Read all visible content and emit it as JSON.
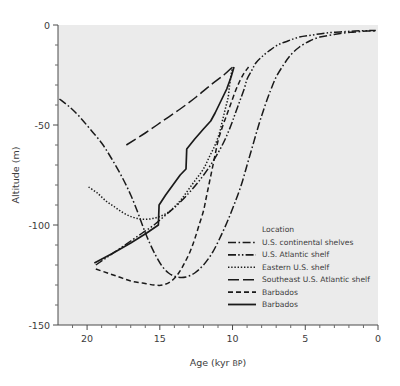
{
  "chart_data": {
    "type": "line",
    "title": "",
    "xlabel": "Age (kyr BP)",
    "ylabel": "Altitude (m)",
    "xlim": [
      22,
      0
    ],
    "ylim": [
      -150,
      0
    ],
    "x_ticks_major": [
      20,
      15,
      10,
      5,
      0
    ],
    "x_tick_labels": [
      "20",
      "15",
      "10",
      "5",
      "0"
    ],
    "x_ticks_minor": [
      21,
      19,
      18,
      17,
      16,
      14,
      13,
      12,
      11,
      9,
      8,
      7,
      6,
      4,
      3,
      2,
      1
    ],
    "y_ticks_major": [
      0,
      -50,
      -100,
      -150
    ],
    "y_tick_labels": [
      "0",
      "-50",
      "-100",
      "-150"
    ],
    "y_ticks_minor": [
      -10,
      -20,
      -30,
      -40,
      -60,
      -70,
      -80,
      -90,
      -110,
      -120,
      -130,
      -140
    ],
    "x_axis_reversed": true,
    "grid": false,
    "background_color": "#ebebeb",
    "line_color": "#1a1a1a",
    "legend": {
      "title": "Location",
      "position": "inside-lower-right"
    },
    "series": [
      {
        "name": "U.S. continental shelves",
        "style": "dashdot",
        "points": [
          [
            21.9,
            -37
          ],
          [
            21.2,
            -41
          ],
          [
            20.5,
            -46
          ],
          [
            19.8,
            -52
          ],
          [
            19.0,
            -59
          ],
          [
            18.3,
            -67
          ],
          [
            17.6,
            -76
          ],
          [
            17.0,
            -85
          ],
          [
            16.5,
            -94
          ],
          [
            16.1,
            -102
          ],
          [
            15.7,
            -109
          ],
          [
            15.3,
            -115
          ],
          [
            14.9,
            -120
          ],
          [
            14.4,
            -124
          ],
          [
            13.8,
            -126
          ],
          [
            13.2,
            -126
          ],
          [
            12.6,
            -124
          ],
          [
            12.0,
            -120
          ],
          [
            11.4,
            -114
          ],
          [
            10.9,
            -107
          ],
          [
            10.4,
            -99
          ],
          [
            9.9,
            -90
          ],
          [
            9.4,
            -80
          ],
          [
            9.0,
            -70
          ],
          [
            8.6,
            -60
          ],
          [
            8.2,
            -50
          ],
          [
            7.8,
            -41
          ],
          [
            7.4,
            -33
          ],
          [
            7.0,
            -26
          ],
          [
            6.5,
            -20
          ],
          [
            6.0,
            -15
          ],
          [
            5.4,
            -11
          ],
          [
            4.7,
            -8
          ],
          [
            4.0,
            -6
          ],
          [
            3.2,
            -5
          ],
          [
            2.4,
            -4
          ],
          [
            1.6,
            -3.5
          ],
          [
            0.8,
            -3
          ],
          [
            0.15,
            -3
          ]
        ]
      },
      {
        "name": "U.S. Atlantic shelf",
        "style": "dashdotdot",
        "points": [
          [
            19.4,
            -120
          ],
          [
            18.6,
            -116
          ],
          [
            17.8,
            -112
          ],
          [
            17.0,
            -108
          ],
          [
            16.2,
            -104
          ],
          [
            15.4,
            -100
          ],
          [
            14.6,
            -95
          ],
          [
            13.8,
            -90
          ],
          [
            13.0,
            -84
          ],
          [
            12.3,
            -78
          ],
          [
            11.6,
            -71
          ],
          [
            11.0,
            -64
          ],
          [
            10.5,
            -57
          ],
          [
            10.1,
            -50
          ],
          [
            9.8,
            -44
          ],
          [
            9.5,
            -38
          ],
          [
            9.2,
            -32
          ],
          [
            9.0,
            -27
          ],
          [
            8.7,
            -23
          ],
          [
            8.4,
            -19
          ],
          [
            8.0,
            -16
          ],
          [
            7.5,
            -13
          ],
          [
            6.9,
            -10
          ],
          [
            6.2,
            -8
          ],
          [
            5.4,
            -6
          ],
          [
            4.5,
            -5
          ],
          [
            3.6,
            -4
          ],
          [
            2.6,
            -3.5
          ],
          [
            1.6,
            -3
          ],
          [
            0.6,
            -2.8
          ],
          [
            0.15,
            -2.7
          ]
        ]
      },
      {
        "name": "Eastern U.S. shelf",
        "style": "dotted",
        "points": [
          [
            19.9,
            -81
          ],
          [
            19.3,
            -84
          ],
          [
            18.7,
            -88
          ],
          [
            18.1,
            -91
          ],
          [
            17.5,
            -94
          ],
          [
            16.9,
            -96
          ],
          [
            16.3,
            -97
          ],
          [
            15.7,
            -97
          ],
          [
            15.1,
            -96
          ],
          [
            14.5,
            -94
          ],
          [
            14.0,
            -91
          ],
          [
            13.5,
            -87
          ],
          [
            13.0,
            -82
          ],
          [
            12.5,
            -77
          ],
          [
            12.0,
            -72
          ],
          [
            11.6,
            -66
          ],
          [
            11.2,
            -60
          ],
          [
            10.9,
            -54
          ],
          [
            10.7,
            -48
          ],
          [
            10.5,
            -42
          ],
          [
            10.3,
            -36
          ],
          [
            10.2,
            -30
          ],
          [
            10.1,
            -25
          ],
          [
            10.0,
            -21
          ]
        ]
      },
      {
        "name": "Southeast U.S. Atlantic shelf",
        "style": "longdash",
        "points": [
          [
            17.3,
            -60
          ],
          [
            16.0,
            -54
          ],
          [
            14.8,
            -48
          ],
          [
            13.6,
            -42
          ],
          [
            12.5,
            -36
          ],
          [
            11.5,
            -30
          ],
          [
            10.6,
            -25
          ],
          [
            10.0,
            -21
          ]
        ]
      },
      {
        "name": "Barbados",
        "style": "dashed",
        "points": [
          [
            19.4,
            -122
          ],
          [
            18.6,
            -124
          ],
          [
            17.8,
            -126
          ],
          [
            17.0,
            -128
          ],
          [
            16.2,
            -129
          ],
          [
            15.4,
            -130
          ],
          [
            14.8,
            -130
          ],
          [
            14.2,
            -128
          ],
          [
            13.7,
            -124
          ],
          [
            13.3,
            -119
          ],
          [
            12.9,
            -113
          ],
          [
            12.6,
            -107
          ],
          [
            12.3,
            -100
          ],
          [
            12.0,
            -93
          ],
          [
            11.8,
            -86
          ],
          [
            11.6,
            -79
          ],
          [
            11.4,
            -72
          ],
          [
            11.2,
            -65
          ],
          [
            11.0,
            -58
          ],
          [
            10.7,
            -51
          ],
          [
            10.4,
            -45
          ],
          [
            10.1,
            -39
          ],
          [
            9.8,
            -33
          ],
          [
            9.5,
            -28
          ],
          [
            9.2,
            -24
          ],
          [
            8.9,
            -21
          ]
        ]
      },
      {
        "name": "Barbados",
        "style": "solid",
        "points": [
          [
            19.5,
            -119
          ],
          [
            18.2,
            -114
          ],
          [
            17.0,
            -109
          ],
          [
            15.9,
            -104
          ],
          [
            15.1,
            -100
          ],
          [
            15.05,
            -90
          ],
          [
            14.6,
            -85
          ],
          [
            14.1,
            -80
          ],
          [
            13.6,
            -75
          ],
          [
            13.2,
            -72
          ],
          [
            13.15,
            -62
          ],
          [
            12.6,
            -57
          ],
          [
            12.0,
            -52
          ],
          [
            11.5,
            -48
          ],
          [
            11.2,
            -44
          ],
          [
            10.8,
            -38
          ],
          [
            10.4,
            -32
          ],
          [
            10.1,
            -26
          ],
          [
            9.9,
            -21
          ]
        ]
      }
    ]
  },
  "axes": {
    "x_title": "Age (kyr BP)",
    "x_title_main": "Age (kyr ",
    "x_title_caps": "BP",
    "x_title_close": ")",
    "y_title": "Altitude (m)"
  },
  "legend": {
    "title": "Location",
    "items": [
      {
        "label": "U.S. continental shelves",
        "style": "dashdot"
      },
      {
        "label": "U.S. Atlantic shelf",
        "style": "dashdotdot"
      },
      {
        "label": "Eastern U.S. shelf",
        "style": "dotted"
      },
      {
        "label": "Southeast U.S. Atlantic shelf",
        "style": "longdash"
      },
      {
        "label": "Barbados",
        "style": "dashed"
      },
      {
        "label": "Barbados",
        "style": "solid"
      }
    ]
  },
  "tick_labels": {
    "x": [
      "20",
      "15",
      "10",
      "5",
      "0"
    ],
    "y": [
      "0",
      "-50",
      "-100",
      "-150"
    ]
  }
}
